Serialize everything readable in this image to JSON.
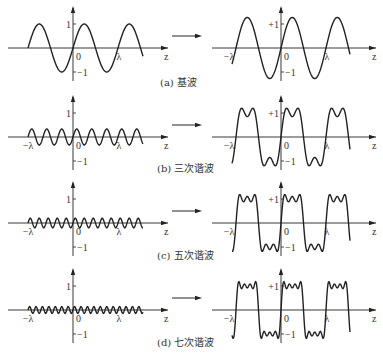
{
  "diagram": {
    "panels": [
      {
        "id": "a",
        "caption": "(a) 基波",
        "harmonic": 1,
        "axis_y": 48
      },
      {
        "id": "b",
        "caption": "(b) 三次谐波",
        "harmonic": 3,
        "axis_y": 137
      },
      {
        "id": "c",
        "caption": "(c) 五次谐波",
        "harmonic": 5,
        "axis_y": 223
      },
      {
        "id": "d",
        "caption": "(d) 七次谐波",
        "harmonic": 7,
        "axis_y": 310
      }
    ],
    "labels": {
      "one": "1",
      "plus_one": "+1",
      "minus_one": "−1",
      "zero": "0",
      "lambda": "λ",
      "minus_lambda": "−λ",
      "z": "z"
    },
    "line_color": "#222222"
  }
}
